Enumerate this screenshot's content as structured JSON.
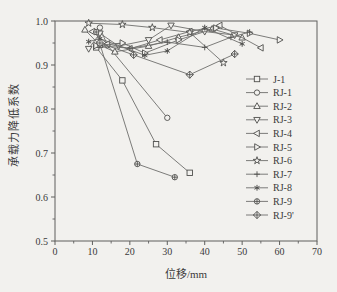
{
  "figure": {
    "background_color": "#f2f1ee",
    "frame_color": "#5f5f5d",
    "line_color": "#6e6e6c",
    "marker_color": "#4f4f4d",
    "text_color": "#3a3a3a"
  },
  "chart_data": {
    "type": "line",
    "title": "",
    "xlabel": "位移/mm",
    "ylabel": "承载力降低系数",
    "xlim": [
      0,
      70
    ],
    "ylim": [
      0.5,
      1.0
    ],
    "xticks": [
      0,
      10,
      20,
      30,
      40,
      50,
      60,
      70
    ],
    "xtick_labels": [
      "0",
      "10",
      "20",
      "30",
      "40",
      "50",
      "60",
      "70"
    ],
    "yticks": [
      0.5,
      0.6,
      0.7,
      0.8,
      0.9,
      1.0
    ],
    "ytick_labels": [
      "0.5",
      "0.6",
      "0.7",
      "0.8",
      "0.9",
      "1.0"
    ],
    "x_minor_step": 5,
    "y_minor_step": 0.05,
    "grid": false,
    "legend_position": "right-middle",
    "series": [
      {
        "name": "J-1",
        "marker": "square",
        "points": [
          [
            11,
            0.94
          ],
          [
            18,
            0.865
          ],
          [
            27,
            0.72
          ],
          [
            36,
            0.655
          ]
        ]
      },
      {
        "name": "RJ-1",
        "marker": "circle",
        "points": [
          [
            12,
            0.985
          ],
          [
            14,
            0.945
          ],
          [
            30,
            0.78
          ]
        ]
      },
      {
        "name": "RJ-2",
        "marker": "triangle-up",
        "points": [
          [
            8,
            0.98
          ],
          [
            12,
            0.945
          ],
          [
            16,
            0.93
          ],
          [
            25,
            0.943
          ],
          [
            33,
            0.963
          ],
          [
            42,
            0.982
          ],
          [
            50,
            0.962
          ]
        ]
      },
      {
        "name": "RJ-3",
        "marker": "triangle-down",
        "points": [
          [
            9,
            0.937
          ],
          [
            12,
            0.972
          ],
          [
            17,
            0.943
          ],
          [
            25,
            0.957
          ],
          [
            31,
            0.99
          ],
          [
            40,
            0.976
          ],
          [
            48,
            0.968
          ]
        ]
      },
      {
        "name": "RJ-4",
        "marker": "triangle-left",
        "points": [
          [
            10,
            0.976
          ],
          [
            14,
            0.948
          ],
          [
            20,
            0.937
          ],
          [
            28,
            0.957
          ],
          [
            36,
            0.976
          ],
          [
            44,
            0.99
          ],
          [
            55,
            0.939
          ]
        ]
      },
      {
        "name": "RJ-5",
        "marker": "triangle-right",
        "points": [
          [
            11,
            0.944
          ],
          [
            18,
            0.95
          ],
          [
            24,
            0.927
          ],
          [
            33,
            0.957
          ],
          [
            43,
            0.984
          ],
          [
            52,
            0.972
          ],
          [
            60,
            0.957
          ]
        ]
      },
      {
        "name": "RJ-6",
        "marker": "star",
        "points": [
          [
            9,
            0.995
          ],
          [
            18,
            0.992
          ],
          [
            26,
            0.985
          ],
          [
            36,
            0.974
          ],
          [
            45,
            0.905
          ]
        ]
      },
      {
        "name": "RJ-7",
        "marker": "plus",
        "points": [
          [
            12,
            0.944
          ],
          [
            20,
            0.938
          ],
          [
            30,
            0.952
          ],
          [
            40,
            0.94
          ],
          [
            47,
            0.963
          ],
          [
            52,
            0.975
          ]
        ]
      },
      {
        "name": "RJ-8",
        "marker": "asterisk",
        "points": [
          [
            9,
            0.953
          ],
          [
            12,
            0.96
          ],
          [
            24,
            0.922
          ],
          [
            30,
            0.932
          ],
          [
            40,
            0.985
          ],
          [
            50,
            0.948
          ]
        ]
      },
      {
        "name": "RJ-9",
        "marker": "circle-plus",
        "points": [
          [
            11,
            0.975
          ],
          [
            22,
            0.675
          ],
          [
            32,
            0.645
          ]
        ]
      },
      {
        "name": "RJ-9'",
        "marker": "diamond-plus",
        "points": [
          [
            12,
            0.95
          ],
          [
            21,
            0.923
          ],
          [
            36,
            0.878
          ],
          [
            48,
            0.925
          ]
        ]
      }
    ]
  }
}
